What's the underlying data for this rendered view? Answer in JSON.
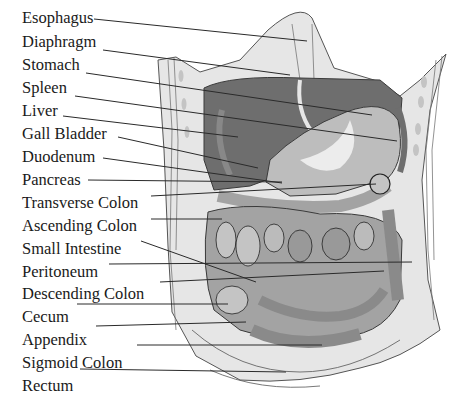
{
  "diagram": {
    "colors": {
      "background": "#ffffff",
      "body_wall": "#e6e6e6",
      "liver": "#6e6e6e",
      "stomach": "#bdbdbd",
      "stomach_highlight": "#ececec",
      "intestine_light": "#c4c4c4",
      "intestine_mid": "#a3a3a3",
      "intestine_dark": "#8a8a8a",
      "outline": "#3a3a3a",
      "leader_line": "#2a2a2a",
      "text": "#1a1a1a"
    },
    "labels": [
      {
        "id": "esophagus",
        "text": "Esophagus",
        "y": 8,
        "line": {
          "x1": 94,
          "y1": 19,
          "x2": 307,
          "y2": 41
        }
      },
      {
        "id": "diaphragm",
        "text": "Diaphragm",
        "y": 32,
        "line": {
          "x1": 103,
          "y1": 50,
          "x2": 290,
          "y2": 75
        }
      },
      {
        "id": "stomach",
        "text": "Stomach",
        "y": 55,
        "line": {
          "x1": 86,
          "y1": 73,
          "x2": 372,
          "y2": 115
        }
      },
      {
        "id": "spleen",
        "text": "Spleen",
        "y": 78,
        "line": {
          "x1": 75,
          "y1": 96,
          "x2": 397,
          "y2": 141
        }
      },
      {
        "id": "liver",
        "text": "Liver",
        "y": 101,
        "line": {
          "x1": 63,
          "y1": 116,
          "x2": 238,
          "y2": 137
        }
      },
      {
        "id": "gall-bladder",
        "text": "Gall Bladder",
        "y": 124,
        "line": {
          "x1": 118,
          "y1": 137,
          "x2": 258,
          "y2": 168
        }
      },
      {
        "id": "duodenum",
        "text": "Duodenum",
        "y": 147,
        "line": {
          "x1": 103,
          "y1": 158,
          "x2": 282,
          "y2": 183
        }
      },
      {
        "id": "pancreas",
        "text": "Pancreas",
        "y": 170,
        "line": {
          "x1": 88,
          "y1": 180,
          "x2": 282,
          "y2": 182
        }
      },
      {
        "id": "transverse-colon",
        "text": "Transverse Colon",
        "y": 193,
        "line": {
          "x1": 151,
          "y1": 196,
          "x2": 376,
          "y2": 184
        }
      },
      {
        "id": "ascending-colon",
        "text": "Ascending Colon",
        "y": 216,
        "line": {
          "x1": 151,
          "y1": 219,
          "x2": 222,
          "y2": 219
        }
      },
      {
        "id": "small-intestine",
        "text": "Small Intestine",
        "y": 239,
        "line": {
          "x1": 141,
          "y1": 241,
          "x2": 256,
          "y2": 282
        }
      },
      {
        "id": "peritoneum",
        "text": "Peritoneum",
        "y": 262,
        "line": {
          "x1": 109,
          "y1": 264,
          "x2": 412,
          "y2": 262
        }
      },
      {
        "id": "descending-colon",
        "text": "Descending Colon",
        "y": 284,
        "line": {
          "x1": 160,
          "y1": 282,
          "x2": 384,
          "y2": 271
        }
      },
      {
        "id": "cecum",
        "text": "Cecum",
        "y": 307,
        "line": {
          "x1": 77,
          "y1": 304,
          "x2": 228,
          "y2": 304
        }
      },
      {
        "id": "appendix",
        "text": "Appendix",
        "y": 330,
        "line": {
          "x1": 96,
          "y1": 326,
          "x2": 246,
          "y2": 322
        }
      },
      {
        "id": "sigmoid-colon",
        "text": "Sigmoid Colon",
        "y": 353,
        "line": {
          "x1": 137,
          "y1": 345,
          "x2": 322,
          "y2": 345
        }
      },
      {
        "id": "rectum",
        "text": "Rectum",
        "y": 376,
        "line": {
          "x1": 80,
          "y1": 369,
          "x2": 286,
          "y2": 372
        }
      }
    ]
  }
}
